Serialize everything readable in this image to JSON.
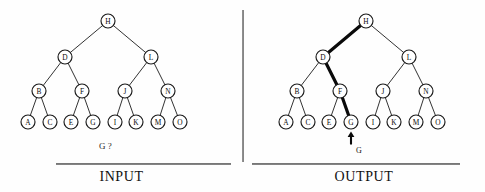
{
  "figure": {
    "background_color": "#fefefe",
    "ink_color": "#1a1a1a",
    "highlight_color": "#0a0a0a"
  },
  "panels": {
    "input": {
      "caption": "INPUT",
      "query_text": "G ?"
    },
    "output": {
      "caption": "OUTPUT",
      "found_label": "G"
    }
  },
  "tree": {
    "description": "Complete binary search tree of 15 nodes, labels A through O in in-order sequence",
    "levels": [
      [
        "H"
      ],
      [
        "D",
        "L"
      ],
      [
        "B",
        "F",
        "J",
        "N"
      ],
      [
        "A",
        "C",
        "E",
        "G",
        "I",
        "K",
        "M",
        "O"
      ]
    ],
    "nodes": [
      {
        "id": "H",
        "label": "H",
        "level": 0,
        "x": 108,
        "y": 21
      },
      {
        "id": "D",
        "label": "D",
        "level": 1,
        "x": 65,
        "y": 57
      },
      {
        "id": "L",
        "label": "L",
        "level": 1,
        "x": 151,
        "y": 57
      },
      {
        "id": "B",
        "label": "B",
        "level": 2,
        "x": 39,
        "y": 91
      },
      {
        "id": "F",
        "label": "F",
        "level": 2,
        "x": 82,
        "y": 91
      },
      {
        "id": "J",
        "label": "J",
        "level": 2,
        "x": 125,
        "y": 91
      },
      {
        "id": "N",
        "label": "N",
        "level": 2,
        "x": 168,
        "y": 91
      },
      {
        "id": "A",
        "label": "A",
        "level": 3,
        "x": 28,
        "y": 122
      },
      {
        "id": "C",
        "label": "C",
        "level": 3,
        "x": 50,
        "y": 122
      },
      {
        "id": "E",
        "label": "E",
        "level": 3,
        "x": 71,
        "y": 122
      },
      {
        "id": "G",
        "label": "G",
        "level": 3,
        "x": 93,
        "y": 122
      },
      {
        "id": "I",
        "label": "I",
        "level": 3,
        "x": 115,
        "y": 122
      },
      {
        "id": "K",
        "label": "K",
        "level": 3,
        "x": 136,
        "y": 122
      },
      {
        "id": "M",
        "label": "M",
        "level": 3,
        "x": 158,
        "y": 122
      },
      {
        "id": "O",
        "label": "O",
        "level": 3,
        "x": 180,
        "y": 122
      }
    ],
    "edges": [
      {
        "from": "H",
        "to": "D"
      },
      {
        "from": "H",
        "to": "L"
      },
      {
        "from": "D",
        "to": "B"
      },
      {
        "from": "D",
        "to": "F"
      },
      {
        "from": "L",
        "to": "J"
      },
      {
        "from": "L",
        "to": "N"
      },
      {
        "from": "B",
        "to": "A"
      },
      {
        "from": "B",
        "to": "C"
      },
      {
        "from": "F",
        "to": "E"
      },
      {
        "from": "F",
        "to": "G"
      },
      {
        "from": "J",
        "to": "I"
      },
      {
        "from": "J",
        "to": "K"
      },
      {
        "from": "N",
        "to": "M"
      },
      {
        "from": "N",
        "to": "O"
      }
    ],
    "node_radius": 7.0,
    "output_x_offset": 258,
    "highlighted_path": [
      "H",
      "D",
      "F",
      "G"
    ],
    "highlighted_edges": [
      {
        "from": "H",
        "to": "D"
      },
      {
        "from": "D",
        "to": "F"
      },
      {
        "from": "F",
        "to": "G"
      }
    ],
    "target_node": "G"
  }
}
